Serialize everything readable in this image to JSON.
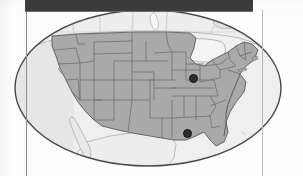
{
  "figure": {
    "kind": "map",
    "projection": "oval / elliptical frame",
    "caption": ""
  },
  "frame": {
    "top_band_color": "#3b3b3b",
    "rule_color": "#8c8c8c",
    "oval_outline_color": "#4a4a4a",
    "oval_fill_color": "#e2e2e2"
  },
  "map": {
    "land_fill": "#a9a9a9",
    "land_outline": "#5f5f5f",
    "water_fill": "#f2f2f2",
    "neighbor_fill": "#ededed",
    "neighbor_outline": "#9a9a9a",
    "regions": [
      {
        "name": "contiguous-united-states",
        "fill": "#a9a9a9"
      },
      {
        "name": "canada",
        "fill": "#ededed"
      },
      {
        "name": "mexico",
        "fill": "#ededed"
      },
      {
        "name": "great-lakes",
        "fill": "#f2f2f2"
      },
      {
        "name": "atlantic-ocean",
        "fill": "#f2f2f2"
      },
      {
        "name": "pacific-ocean",
        "fill": "#f2f2f2"
      },
      {
        "name": "gulf-of-mexico",
        "fill": "#f2f2f2"
      }
    ]
  },
  "markers": [
    {
      "id": "marker-midwest",
      "label": "",
      "x": 193,
      "y": 78,
      "color": "#2e2e2e",
      "region": "Illinois / Indiana border area"
    },
    {
      "id": "marker-gulf-coast",
      "label": "",
      "x": 187,
      "y": 133,
      "color": "#2e2e2e",
      "region": "Louisiana Gulf coast"
    }
  ],
  "labels": []
}
